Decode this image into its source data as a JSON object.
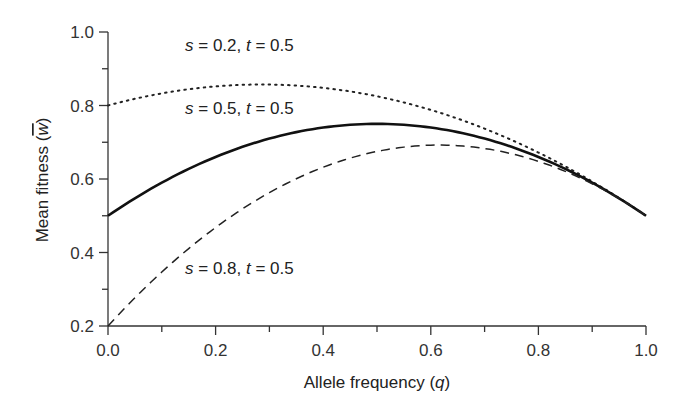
{
  "chart_data": {
    "type": "line",
    "title": "",
    "xlabel": "Allele frequency (q)",
    "ylabel": "Mean fitness (w̄)",
    "xlim": [
      0.0,
      1.0
    ],
    "ylim": [
      0.2,
      1.0
    ],
    "xticks": [
      "0.0",
      "0.2",
      "0.4",
      "0.6",
      "0.8",
      "1.0"
    ],
    "yticks": [
      "0.2",
      "0.4",
      "0.6",
      "0.8",
      "1.0"
    ],
    "grid": false,
    "legend": "none (inline annotations)",
    "series": [
      {
        "name": "s = 0.2, t = 0.5",
        "style": "dotted",
        "x": [
          0.0,
          0.1,
          0.2,
          0.286,
          0.4,
          0.5,
          0.6,
          0.7,
          0.8,
          0.9,
          1.0
        ],
        "values": [
          0.8,
          0.833,
          0.852,
          0.857,
          0.848,
          0.825,
          0.788,
          0.737,
          0.672,
          0.594,
          0.5
        ]
      },
      {
        "name": "s = 0.5, t = 0.5",
        "style": "solid",
        "x": [
          0.0,
          0.1,
          0.2,
          0.3,
          0.4,
          0.5,
          0.6,
          0.7,
          0.8,
          0.9,
          1.0
        ],
        "values": [
          0.5,
          0.59,
          0.66,
          0.71,
          0.74,
          0.75,
          0.74,
          0.71,
          0.66,
          0.59,
          0.5
        ]
      },
      {
        "name": "s = 0.8, t = 0.5",
        "style": "dashed",
        "x": [
          0.0,
          0.1,
          0.2,
          0.3,
          0.4,
          0.5,
          0.615,
          0.7,
          0.8,
          0.9,
          1.0
        ],
        "values": [
          0.2,
          0.347,
          0.468,
          0.563,
          0.632,
          0.675,
          0.692,
          0.683,
          0.648,
          0.587,
          0.5
        ]
      }
    ],
    "annotations": [
      {
        "s": "0.2",
        "t": "0.5"
      },
      {
        "s": "0.5",
        "t": "0.5"
      },
      {
        "s": "0.8",
        "t": "0.5"
      }
    ]
  },
  "labels": {
    "xlabel_main": "Allele frequency (",
    "xlabel_var": "q",
    "xlabel_end": ")",
    "ylabel_main": "Mean fitness (",
    "ylabel_var": "w",
    "ylabel_end": ")",
    "eq": " = ",
    "comma": ", "
  }
}
